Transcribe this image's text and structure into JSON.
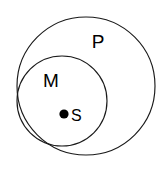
{
  "diagram": {
    "type": "euler-diagram",
    "title": "",
    "background_color": "#ffffff",
    "stroke_color": "#1a1a1a",
    "dot_color": "#000000",
    "sets": [
      {
        "id": "P",
        "label": "P",
        "role": "outer-set",
        "cx": 86,
        "cy": 86,
        "r": 69,
        "label_x": 98,
        "label_y": 48
      },
      {
        "id": "M",
        "label": "M",
        "role": "inner-set",
        "cx": 62,
        "cy": 101,
        "r": 45,
        "label_x": 51,
        "label_y": 87
      }
    ],
    "points": [
      {
        "id": "S",
        "label": "S",
        "cx": 64,
        "cy": 114,
        "r": 4.6,
        "label_x": 71,
        "label_y": 121
      }
    ]
  }
}
